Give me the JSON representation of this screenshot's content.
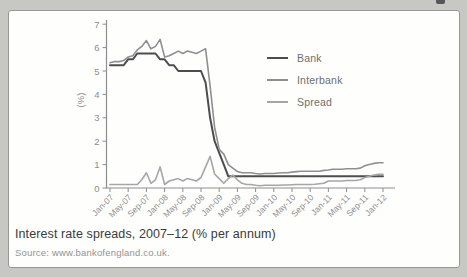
{
  "figure": {
    "caption": "Interest rate spreads, 2007–12 (% per annum)",
    "source_label": "Source:",
    "source_url": "www.bankofengland.co.uk.",
    "colors": {
      "page_background": "#c7c8c3",
      "panel_background": "#fefefd",
      "panel_border": "#979797",
      "axis": "#8d8d8f",
      "caption_text": "#3a3a3c",
      "source_text": "#929294",
      "legend_text": "#6e6e70"
    }
  },
  "chart_data": {
    "type": "line",
    "title": "Interest rate spreads, 2007–12 (% per annum)",
    "xlabel": "",
    "ylabel": "(%)",
    "ylim": [
      0,
      7
    ],
    "yticks": [
      0,
      1,
      2,
      3,
      4,
      5,
      6,
      7
    ],
    "grid": false,
    "legend_position": "upper right",
    "x_interval": "monthly",
    "x_start": "Jan-07",
    "x_end": "Jan-12",
    "x_tick_labels": [
      "Jan-07",
      "May-07",
      "Sep-07",
      "Jan-08",
      "May-08",
      "Sep-08",
      "Jan-09",
      "May-09",
      "Sep-09",
      "Jan-10",
      "May-10",
      "Sep-10",
      "Jan-11",
      "May-11",
      "Sep-11",
      "Jan-12"
    ],
    "x_tick_every_months": 4,
    "series": [
      {
        "name": "Bank",
        "color": "#4d4d4f",
        "width": 2,
        "values": [
          5.25,
          5.25,
          5.25,
          5.25,
          5.5,
          5.5,
          5.75,
          5.75,
          5.75,
          5.75,
          5.75,
          5.5,
          5.5,
          5.25,
          5.25,
          5,
          5,
          5,
          5,
          5,
          5,
          4.5,
          3,
          2,
          1.5,
          1,
          0.5,
          0.5,
          0.5,
          0.5,
          0.5,
          0.5,
          0.5,
          0.5,
          0.5,
          0.5,
          0.5,
          0.5,
          0.5,
          0.5,
          0.5,
          0.5,
          0.5,
          0.5,
          0.5,
          0.5,
          0.5,
          0.5,
          0.5,
          0.5,
          0.5,
          0.5,
          0.5,
          0.5,
          0.5,
          0.5,
          0.5,
          0.5,
          0.5,
          0.5,
          0.5
        ]
      },
      {
        "name": "Interbank",
        "color": "#8f8f91",
        "width": 1.6,
        "values": [
          5.35,
          5.4,
          5.4,
          5.45,
          5.6,
          5.65,
          5.9,
          6.05,
          6.3,
          5.95,
          6.05,
          6.35,
          5.6,
          5.65,
          5.75,
          5.85,
          5.75,
          5.85,
          5.8,
          5.75,
          5.85,
          5.95,
          4.35,
          2.6,
          1.65,
          1.45,
          1.0,
          0.85,
          0.7,
          0.65,
          0.65,
          0.65,
          0.62,
          0.6,
          0.62,
          0.62,
          0.62,
          0.64,
          0.65,
          0.65,
          0.68,
          0.7,
          0.72,
          0.72,
          0.72,
          0.72,
          0.72,
          0.75,
          0.77,
          0.8,
          0.8,
          0.8,
          0.82,
          0.82,
          0.82,
          0.85,
          0.95,
          1.0,
          1.05,
          1.08,
          1.08
        ]
      },
      {
        "name": "Spread",
        "color": "#a6a6a8",
        "width": 1.6,
        "values": [
          0.15,
          0.15,
          0.15,
          0.15,
          0.15,
          0.15,
          0.15,
          0.35,
          0.65,
          0.2,
          0.35,
          0.9,
          0.15,
          0.3,
          0.35,
          0.4,
          0.3,
          0.4,
          0.35,
          0.3,
          0.45,
          0.9,
          1.35,
          0.6,
          0.4,
          0.2,
          0.4,
          0.55,
          0.35,
          0.2,
          0.15,
          0.15,
          0.12,
          0.1,
          0.12,
          0.12,
          0.12,
          0.12,
          0.13,
          0.13,
          0.14,
          0.15,
          0.15,
          0.15,
          0.15,
          0.16,
          0.18,
          0.2,
          0.3,
          0.3,
          0.3,
          0.3,
          0.32,
          0.32,
          0.32,
          0.35,
          0.45,
          0.5,
          0.55,
          0.58,
          0.58
        ]
      }
    ]
  }
}
